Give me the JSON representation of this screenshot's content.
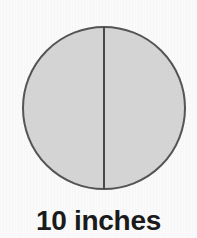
{
  "figure": {
    "name": "circle-with-vertical-diameter",
    "caption": "10 inches",
    "measurement_value": "10",
    "measurement_unit": "inches",
    "background_color": "#fbfbfb",
    "caption_color": "#1b1b1b"
  },
  "shapes": {
    "circle": {
      "label": "circle",
      "center_x": 104,
      "center_y": 108,
      "radius": 81,
      "fill_color": "#d6d6d6",
      "stroke_color": "#565656",
      "stroke_width": "2"
    },
    "diameter_line": {
      "label": "vertical-diameter",
      "x": 104,
      "y_top": 27,
      "y_bottom": 189,
      "stroke_color": "#4a4a4a",
      "stroke_width": "2"
    }
  }
}
